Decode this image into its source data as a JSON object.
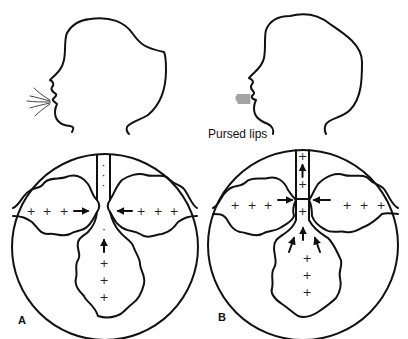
{
  "figure": {
    "panels": [
      {
        "id": "A",
        "label": "A",
        "mouth": "open",
        "airflow": "normal exhalation",
        "alveoli_symbols": "+",
        "airway_symbols": ":",
        "airway_state": "collapsed at bifurcation"
      },
      {
        "id": "B",
        "label": "B",
        "mouth": "pursed",
        "annotation": "Pursed lips",
        "airflow": "pursed-lip exhalation",
        "alveoli_symbols": "+",
        "airway_symbols": "+",
        "airway_state": "held open by back pressure"
      }
    ],
    "colors": {
      "stroke": "#111111",
      "background": "#ffffff"
    }
  },
  "labels": {
    "panel_a": "A",
    "panel_b": "B",
    "pursed_lips": "Pursed lips"
  },
  "symbols": {
    "plus": "+",
    "dot": "·"
  }
}
